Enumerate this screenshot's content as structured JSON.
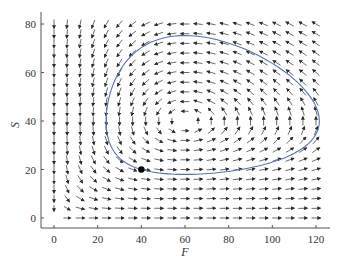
{
  "chart_data": {
    "type": "vector_field_with_trajectory",
    "title": "",
    "xlabel": "F",
    "ylabel": "S",
    "xlim": [
      -6,
      126
    ],
    "ylim": [
      -4,
      83
    ],
    "xticks": [
      0,
      20,
      40,
      60,
      80,
      100,
      120
    ],
    "yticks": [
      0,
      20,
      40,
      60,
      80
    ],
    "grid": false,
    "legend": null,
    "vector_field": {
      "model": "Lotka-Volterra: dF/dt = a*F - b*F*S, dS/dt = -c*S + d*F*S",
      "params": {
        "a": 0.5,
        "b": 0.0125,
        "c": 0.39,
        "d": 0.0065
      },
      "equilibrium": {
        "F": 60,
        "S": 40
      },
      "grid_F": {
        "start": 0,
        "stop": 120,
        "step": 6
      },
      "grid_S": {
        "start": 0,
        "stop": 80,
        "step": 4
      },
      "direction": "counterclockwise"
    },
    "trajectory": {
      "initial_point": {
        "F": 40,
        "S": 20
      },
      "shape": "closed orbit",
      "approx_extent": {
        "F_min": 24,
        "F_max": 123,
        "S_min": 18,
        "S_max": 76
      }
    },
    "marked_point": {
      "F": 40,
      "S": 20,
      "label": ""
    }
  },
  "colors": {
    "background": "#ffffff",
    "axis": "#555555",
    "arrow": "#2b2b2b",
    "trajectory": "#5575a8",
    "point": "#000000",
    "text": "#333333"
  },
  "labels": {
    "x_axis": "F",
    "y_axis": "S",
    "xtick_labels": [
      "0",
      "20",
      "40",
      "60",
      "80",
      "100",
      "120"
    ],
    "ytick_labels": [
      "0",
      "20",
      "40",
      "60",
      "80"
    ]
  }
}
